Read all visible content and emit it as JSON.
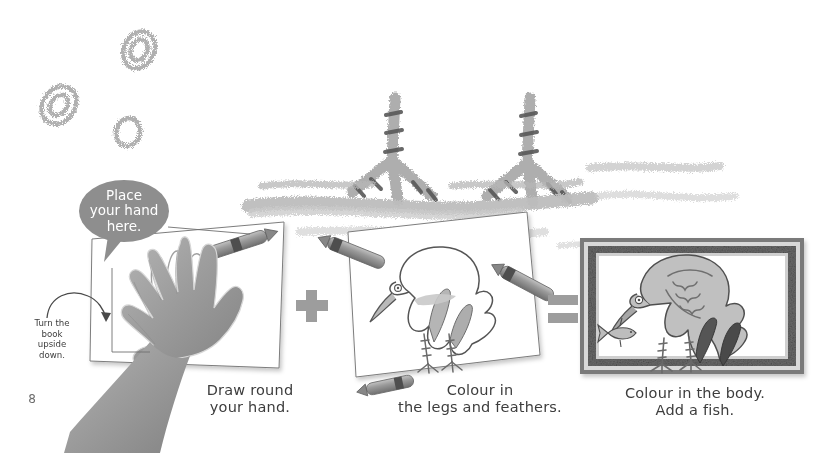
{
  "page": {
    "number": "8",
    "background_color": "#ffffff",
    "ink_color": "#3d3d3d",
    "crayon_gray": "#a8a8a8",
    "crayon_dark": "#6e6e6e",
    "bubble_color": "#8e8e8e",
    "skin_color": "#9b9b9b"
  },
  "callouts": {
    "speech_bubble": "Place\nyour hand\nhere.",
    "turn_note": "Turn the\nbook\nupside\ndown."
  },
  "steps": [
    {
      "id": "step-1",
      "caption": "Draw round\nyour hand."
    },
    {
      "id": "step-2",
      "caption": "Colour in\nthe legs and feathers."
    },
    {
      "id": "step-3",
      "caption": "Colour in the body.\nAdd a fish."
    }
  ],
  "operators": {
    "plus": "+",
    "equals": "="
  },
  "icons": {
    "crayon": "crayon-icon",
    "hand": "hand-icon",
    "bird": "bird-icon",
    "fish": "fish-icon",
    "frame": "picture-frame-icon",
    "scribble": "crayon-scribble-icon",
    "arrow": "curved-arrow-icon"
  }
}
